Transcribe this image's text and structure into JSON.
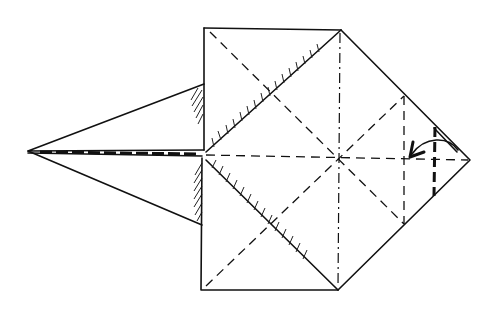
{
  "diagram": {
    "type": "origami-fold-diagram",
    "colors": {
      "line": "#111111",
      "background": "#ffffff"
    },
    "elements": {
      "square": {
        "x1": 204,
        "y1": 28,
        "x2": 341,
        "y2": 290
      },
      "diamond": {
        "top": [
          341,
          30
        ],
        "right": [
          470,
          158
        ],
        "bottom": [
          338,
          290
        ],
        "left": [
          204,
          155
        ]
      },
      "center": [
        338,
        157
      ],
      "left_kite": {
        "tip": [
          28,
          151
        ],
        "upper": [
          204,
          84
        ],
        "lower": [
          202,
          225
        ]
      },
      "fold_lines": {
        "valley_horizontal": "dashed line through center",
        "mountain_vertical": "dash-dot line through center",
        "valley_diagonals": "dashed diagonals of square",
        "valley_vertical_right": "dashed vertical line x=404",
        "fold_line_thick": "bold dashed vertical line x=434"
      },
      "arrow": {
        "meaning": "fold right point inward",
        "from": [
          458,
          148
        ],
        "to": [
          410,
          157
        ]
      }
    },
    "labels": []
  }
}
